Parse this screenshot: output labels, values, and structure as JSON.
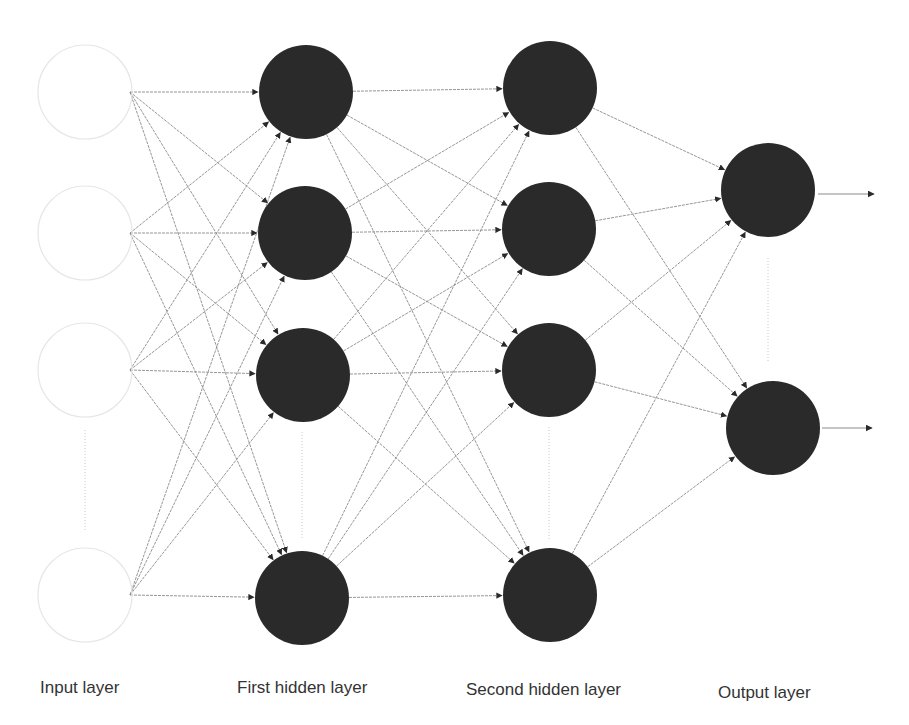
{
  "colors": {
    "background": "#ffffff",
    "node_fill": "#2a2a2a",
    "input_outline": "#e6e6e6",
    "edge": "#8a8a8a",
    "arrowhead": "#2a2a2a",
    "ellipsis_dots": "#c8c8c8",
    "label_text": "#333333"
  },
  "layers": [
    {
      "id": "input",
      "label": "Input layer",
      "label_pos": [
        40,
        678
      ],
      "style": "hollow",
      "nodes": [
        [
          85,
          92
        ],
        [
          85,
          233
        ],
        [
          85,
          370
        ],
        [
          85,
          595
        ]
      ],
      "edge_origin_x": 130,
      "ellipsis": [
        85,
        430,
        85,
        532
      ]
    },
    {
      "id": "hidden1",
      "label": "First hidden layer",
      "label_pos": [
        237,
        678
      ],
      "style": "filled",
      "nodes": [
        [
          306,
          92
        ],
        [
          305,
          233
        ],
        [
          303,
          375
        ],
        [
          302,
          598
        ]
      ],
      "ellipsis": [
        302,
        432,
        302,
        540
      ]
    },
    {
      "id": "hidden2",
      "label": "Second hidden layer",
      "label_pos": [
        466,
        680
      ],
      "style": "filled",
      "nodes": [
        [
          550,
          88
        ],
        [
          549,
          229
        ],
        [
          549,
          370
        ],
        [
          550,
          595
        ]
      ],
      "ellipsis": [
        549,
        427,
        549,
        540
      ]
    },
    {
      "id": "output",
      "label": "Output layer",
      "label_pos": [
        718,
        683
      ],
      "style": "filled",
      "nodes": [
        [
          768,
          190
        ],
        [
          773,
          428
        ]
      ],
      "ellipsis": [
        768,
        258,
        768,
        362
      ]
    }
  ],
  "node_radius": 47,
  "output_arrows": [
    {
      "from": [
        818,
        194
      ],
      "to": [
        876,
        194
      ]
    },
    {
      "from": [
        822,
        428
      ],
      "to": [
        874,
        428
      ]
    }
  ]
}
